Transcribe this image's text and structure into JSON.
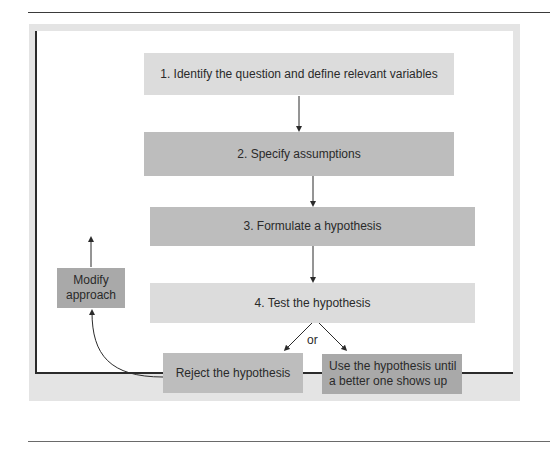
{
  "flowchart": {
    "steps": [
      {
        "id": "step1",
        "label": "1. Identify the question and define relevant variables"
      },
      {
        "id": "step2",
        "label": "2. Specify assumptions"
      },
      {
        "id": "step3",
        "label": "3. Formulate a hypothesis"
      },
      {
        "id": "step4",
        "label": "4. Test the hypothesis"
      }
    ],
    "outcomes": {
      "reject": "Reject the hypothesis",
      "accept": "Use the hypothesis until a better one shows up"
    },
    "modify": "Modify approach",
    "branch_label": "or"
  },
  "colors": {
    "light_box": "#dcdcdc",
    "mid_box": "#bdbdbd",
    "dark_box": "#a9a9a9",
    "frame": "#e4e4e4",
    "line": "#2b2b2b"
  }
}
